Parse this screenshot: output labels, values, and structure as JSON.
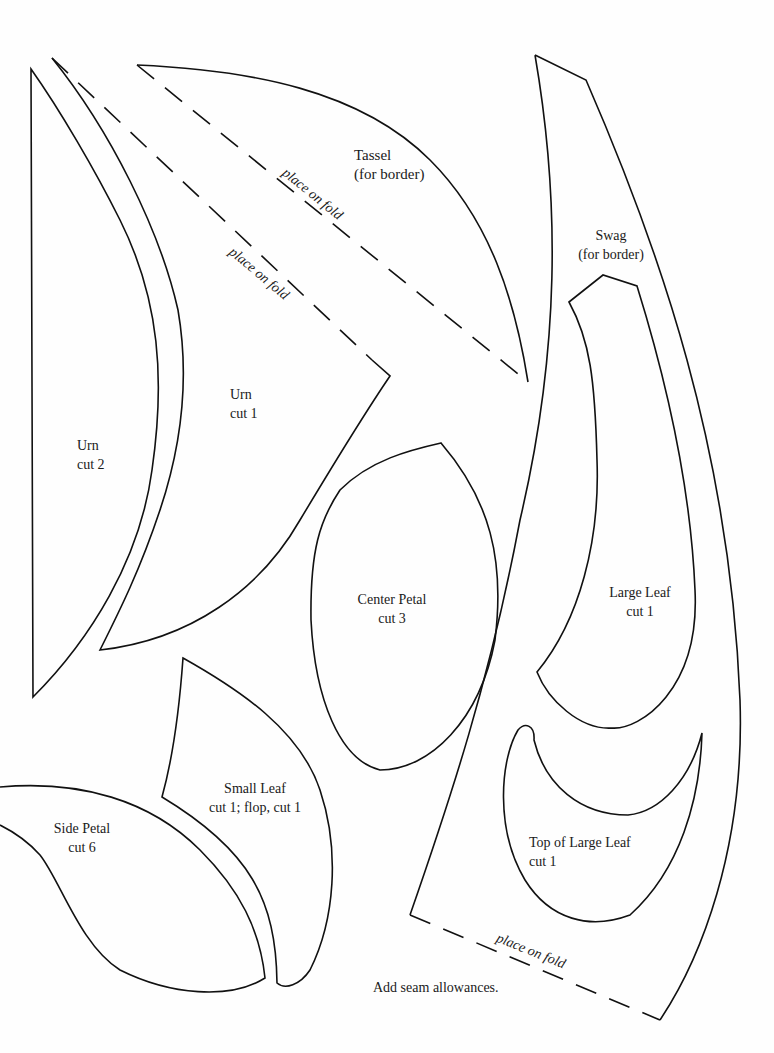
{
  "pieces": {
    "tassel": {
      "name": "Tassel",
      "note": "(for border)",
      "fold_label": "place on fold"
    },
    "urn_cut1": {
      "name": "Urn",
      "note": "cut 1",
      "fold_label": "place on fold"
    },
    "urn_cut2": {
      "name": "Urn",
      "note": "cut 2"
    },
    "swag": {
      "name": "Swag",
      "note": "(for border)",
      "fold_label": "place on fold"
    },
    "center_petal": {
      "name": "Center Petal",
      "note": "cut 3"
    },
    "large_leaf": {
      "name": "Large Leaf",
      "note": "cut 1"
    },
    "small_leaf": {
      "name": "Small Leaf",
      "note": "cut 1; flop, cut 1"
    },
    "side_petal": {
      "name": "Side Petal",
      "note": "cut 6"
    },
    "top_of_large_leaf": {
      "name": "Top of Large Leaf",
      "note": "cut 1"
    }
  },
  "footer_note": "Add seam allowances.",
  "colors": {
    "line": "#111111",
    "paper": "#fefefe"
  }
}
